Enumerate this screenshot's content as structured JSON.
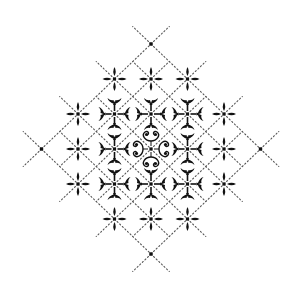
{
  "figure": {
    "title": "Rangoli / kolam dot-lattice pattern",
    "width": 298,
    "height": 292,
    "background": "#ffffff",
    "ink": "#111111",
    "line_color": "#555555"
  },
  "lattice": {
    "origin": [
      151,
      149
    ],
    "dx": 36.5,
    "dy": 35,
    "stub": 0.5
  },
  "nodes": [
    {
      "col": 0,
      "row": -3,
      "type": "dot"
    },
    {
      "col": -1,
      "row": -2,
      "type": "star"
    },
    {
      "col": 0,
      "row": -2,
      "type": "star"
    },
    {
      "col": 1,
      "row": -2,
      "type": "star"
    },
    {
      "col": -2,
      "row": -1,
      "type": "star"
    },
    {
      "col": -1,
      "row": -1,
      "type": "ornate"
    },
    {
      "col": 0,
      "row": -1,
      "type": "ornate"
    },
    {
      "col": 1,
      "row": -1,
      "type": "ornate"
    },
    {
      "col": 2,
      "row": -1,
      "type": "star"
    },
    {
      "col": -3,
      "row": 0,
      "type": "dot"
    },
    {
      "col": -2,
      "row": 0,
      "type": "star"
    },
    {
      "col": -1,
      "row": 0,
      "type": "ornate"
    },
    {
      "col": 0,
      "row": 0,
      "type": "rosette"
    },
    {
      "col": 1,
      "row": 0,
      "type": "ornate"
    },
    {
      "col": 2,
      "row": 0,
      "type": "star"
    },
    {
      "col": 3,
      "row": 0,
      "type": "dot"
    },
    {
      "col": -2,
      "row": 1,
      "type": "star"
    },
    {
      "col": -1,
      "row": 1,
      "type": "ornate"
    },
    {
      "col": 0,
      "row": 1,
      "type": "ornate"
    },
    {
      "col": 1,
      "row": 1,
      "type": "ornate"
    },
    {
      "col": 2,
      "row": 1,
      "type": "star"
    },
    {
      "col": -1,
      "row": 2,
      "type": "star"
    },
    {
      "col": 0,
      "row": 2,
      "type": "star"
    },
    {
      "col": 1,
      "row": 2,
      "type": "star"
    },
    {
      "col": 0,
      "row": 3,
      "type": "dot"
    }
  ]
}
